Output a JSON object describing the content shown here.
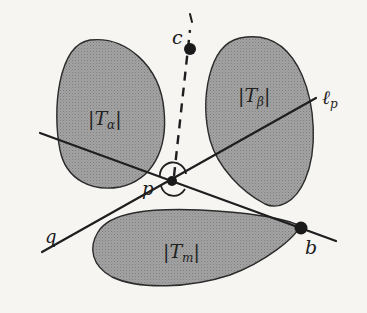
{
  "figure": {
    "colors": {
      "background": "#f6f5f2",
      "region_fill": "#9a9a9a",
      "stroke": "#1e1e1e"
    },
    "regions": [
      {
        "id": "T_alpha",
        "label_main": "|T",
        "label_sub": "α",
        "label_close": "|"
      },
      {
        "id": "T_beta",
        "label_main": "|T",
        "label_sub": "β",
        "label_close": "|"
      },
      {
        "id": "T_m",
        "label_main": "|T",
        "label_sub": "m",
        "label_close": "|"
      }
    ],
    "points": {
      "p": {
        "label": "p"
      },
      "b": {
        "label": "b"
      },
      "c": {
        "label": "c"
      }
    },
    "lines": {
      "l_p": {
        "label_main": "ℓ",
        "label_sub": "p"
      },
      "q": {
        "label": "q"
      }
    }
  }
}
